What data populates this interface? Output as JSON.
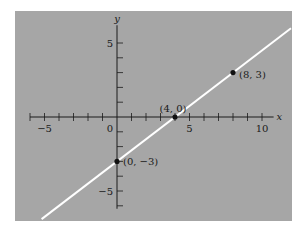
{
  "chart_data": {
    "type": "line",
    "title": "",
    "xlabel": "x",
    "ylabel": "y",
    "xlim": [
      -6,
      10.8
    ],
    "ylim": [
      -6.2,
      6.2
    ],
    "grid": false,
    "background_color": "#a6a6a6",
    "line_color": "#ffffff",
    "axis_color": "#1a1a1a",
    "point_color": "#111111",
    "x_tick_labels": [
      {
        "value": -5,
        "label": "−5"
      },
      {
        "value": 5,
        "label": "5"
      },
      {
        "value": 10,
        "label": "10"
      }
    ],
    "y_tick_labels": [
      {
        "value": 5,
        "label": "5"
      },
      {
        "value": -5,
        "label": "−5"
      }
    ],
    "origin_label": "0",
    "x_ticks": [
      -6,
      -5,
      -4,
      -3,
      -2,
      -1,
      1,
      2,
      3,
      4,
      5,
      6,
      7,
      8,
      9,
      10
    ],
    "y_ticks": [
      -6,
      -5,
      -4,
      -3,
      -2,
      -1,
      1,
      2,
      3,
      4,
      5
    ],
    "series": [
      {
        "name": "y = (3/4)x − 3",
        "slope": 0.75,
        "intercept": -3,
        "x": [
          -5.2,
          12
        ],
        "y": [
          -6.9,
          6
        ]
      }
    ],
    "points": [
      {
        "x": 0,
        "y": -3,
        "label": "(0, −3)"
      },
      {
        "x": 4,
        "y": 0,
        "label": "(4, 0)"
      },
      {
        "x": 8,
        "y": 3,
        "label": "(8, 3)"
      }
    ]
  }
}
